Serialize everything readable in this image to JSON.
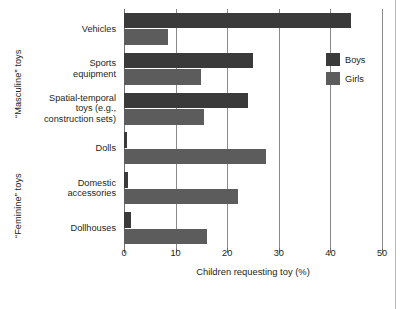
{
  "chart_data": {
    "type": "bar",
    "orientation": "horizontal",
    "title": "",
    "xlabel": "Children requesting toy (%)",
    "ylabel": "",
    "xlim": [
      0,
      50
    ],
    "xticks": [
      0,
      10,
      20,
      30,
      40,
      50
    ],
    "xtick_labels": [
      "0",
      "10",
      "20",
      "30",
      "40",
      "50"
    ],
    "grid": true,
    "grid_axis": "x",
    "legend_position": "upper right",
    "categories": [
      "Vehicles",
      "Sports equipment",
      "Spatial-temporal toys (e.g., construction sets)",
      "Dolls",
      "Domestic accessories",
      "Dollhouses"
    ],
    "category_lines": [
      [
        "Vehicles"
      ],
      [
        "Sports",
        "equipment"
      ],
      [
        "Spatial-temporal",
        "toys (e.g.,",
        "construction sets)"
      ],
      [
        "Dolls"
      ],
      [
        "Domestic",
        "accessories"
      ],
      [
        "Dollhouses"
      ]
    ],
    "series": [
      {
        "name": "Boys",
        "color": "#3b3a3a",
        "values": [
          44.0,
          25.0,
          24.0,
          0.5,
          0.7,
          1.3
        ]
      },
      {
        "name": "Girls",
        "color": "#5d5c5c",
        "values": [
          8.5,
          15.0,
          15.5,
          27.5,
          22.0,
          16.0
        ]
      }
    ],
    "group_brackets": [
      {
        "label": "“Masculine” toys",
        "categories": [
          "Vehicles",
          "Sports equipment",
          "Spatial-temporal toys (e.g., construction sets)"
        ]
      },
      {
        "label": "“Feminine” toys",
        "categories": [
          "Dolls",
          "Domestic accessories",
          "Dollhouses"
        ]
      }
    ]
  },
  "legend": {
    "items": [
      {
        "label": "Boys",
        "color": "#3b3a3a"
      },
      {
        "label": "Girls",
        "color": "#5d5c5c"
      }
    ]
  },
  "axis": {
    "x_title": "Children requesting toy (%)"
  },
  "colors": {
    "boys": "#3b3a3a",
    "girls": "#5d5c5c",
    "axis": "#6f6f6f",
    "grid": "#8a8a8a",
    "text": "#231f20",
    "page_rule": "#b9b9b9",
    "background": "#ffffff"
  }
}
